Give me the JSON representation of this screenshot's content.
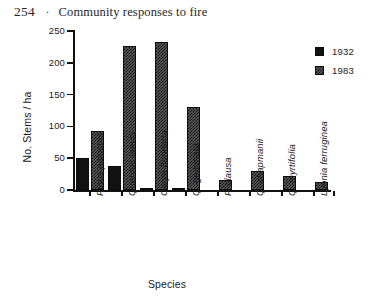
{
  "page": {
    "number": "254",
    "separator": "·",
    "running_title": "Community responses to fire"
  },
  "chart_data": {
    "type": "bar",
    "title": "",
    "xlabel": "Species",
    "ylabel": "No. Stems / ha",
    "ylim": [
      0,
      250
    ],
    "yticks": [
      0,
      50,
      100,
      150,
      200,
      250
    ],
    "grid": false,
    "legend_position": "top-right",
    "categories": [
      "Pinus palustris",
      "Quercus laevis",
      "Carya floridana",
      "Q. geminata",
      "P. clausa",
      "Q. chapmanii",
      "Q. myrtifolia",
      "Lyonia ferruginea"
    ],
    "series": [
      {
        "name": "1932",
        "values": [
          50,
          37,
          3,
          2,
          0,
          0,
          0,
          0
        ]
      },
      {
        "name": "1983",
        "values": [
          93,
          226,
          232,
          130,
          16,
          30,
          22,
          13
        ]
      }
    ]
  }
}
